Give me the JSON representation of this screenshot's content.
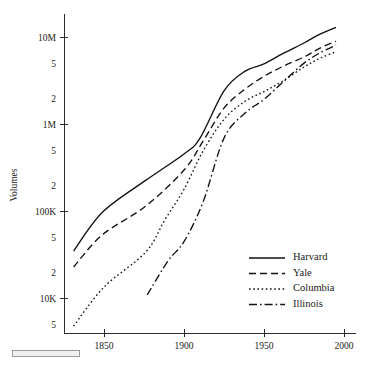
{
  "figure": {
    "background_color": "#ffffff",
    "line_color": "#111111",
    "axis_color": "#2b2b2b"
  },
  "chart_data": {
    "type": "line",
    "title": "",
    "subtitle": "",
    "xlabel": "",
    "ylabel": "Volumes",
    "yscale": "log",
    "xscale": "linear",
    "grid": false,
    "legend_position": "bottom-right",
    "xlim": [
      1825,
      2005
    ],
    "ylim": [
      4000,
      16000000
    ],
    "xticks": [
      1850,
      1900,
      1950,
      2000
    ],
    "xticklabels": [
      "1850",
      "1900",
      "1950",
      "2000"
    ],
    "yticks": [
      5000,
      10000,
      20000,
      50000,
      100000,
      200000,
      500000,
      1000000,
      2000000,
      5000000,
      10000000
    ],
    "yticklabels": [
      "5",
      "10K",
      "2",
      "5",
      "100K",
      "2",
      "5",
      "1M",
      "2",
      "5",
      "10M"
    ],
    "ymajorticks": [
      10000,
      100000,
      1000000,
      10000000
    ],
    "series": [
      {
        "name": "Harvard",
        "style": "solid",
        "x": [
          1831,
          1849,
          1876,
          1900,
          1910,
          1925,
          1938,
          1950,
          1962,
          1975,
          1985,
          1995
        ],
        "y": [
          35000,
          98000,
          228000,
          460000,
          700000,
          2450000,
          4100000,
          5000000,
          6600000,
          8700000,
          11000000,
          13200000
        ]
      },
      {
        "name": "Yale",
        "style": "dashed",
        "x": [
          1831,
          1849,
          1876,
          1900,
          1912,
          1925,
          1938,
          1950,
          1962,
          1975,
          1985,
          1995
        ],
        "y": [
          23000,
          54000,
          115000,
          300000,
          650000,
          1550000,
          2550000,
          3600000,
          4700000,
          6000000,
          7600000,
          9100000
        ]
      },
      {
        "name": "Columbia",
        "style": "dotted",
        "x": [
          1831,
          1850,
          1876,
          1888,
          1900,
          1912,
          1925,
          1938,
          1950,
          1962,
          1975,
          1985,
          1995
        ],
        "y": [
          4800,
          13500,
          34000,
          80000,
          180000,
          500000,
          1150000,
          1850000,
          2400000,
          3200000,
          4600000,
          5800000,
          6900000
        ]
      },
      {
        "name": "Illinois",
        "style": "dashdot",
        "x": [
          1877,
          1890,
          1900,
          1912,
          1925,
          1938,
          1950,
          1962,
          1975,
          1985,
          1995
        ],
        "y": [
          11000,
          27000,
          45000,
          130000,
          700000,
          1350000,
          1950000,
          3100000,
          5100000,
          6700000,
          8200000
        ]
      }
    ],
    "legend": [
      {
        "label": "Harvard",
        "style": "solid"
      },
      {
        "label": "Yale",
        "style": "dashed"
      },
      {
        "label": "Columbia",
        "style": "dotted"
      },
      {
        "label": "Illinois",
        "style": "dashdot"
      }
    ]
  },
  "decorations": {
    "scale_bar_present": true
  }
}
